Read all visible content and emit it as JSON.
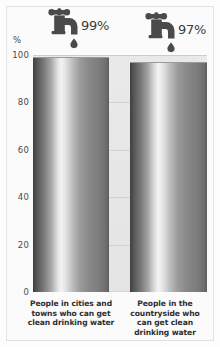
{
  "chart_data": {
    "type": "bar",
    "title": "",
    "subtitle": "",
    "xlabel": "",
    "ylabel": "%",
    "ylim": [
      0,
      100
    ],
    "grid": true,
    "legend": "none",
    "categories": [
      "People in cities and towns who can get clean drinking water",
      "People in the countryside who can get clean drinking water"
    ],
    "values": [
      99,
      97
    ],
    "value_labels": [
      "99%",
      "97%"
    ],
    "ticks": [
      {
        "value": 100,
        "label": "100"
      },
      {
        "value": 80,
        "label": "80"
      },
      {
        "value": 60,
        "label": "60"
      },
      {
        "value": 40,
        "label": "40"
      },
      {
        "value": 20,
        "label": "20"
      },
      {
        "value": 0,
        "label": "0"
      }
    ],
    "annotations": [
      {
        "icon": "tap-icon",
        "label": "99%"
      },
      {
        "icon": "tap-icon",
        "label": "97%"
      }
    ],
    "colors": {
      "bar_dark": "#3f3f3f",
      "bar_highlight": "#f4f4f4",
      "plot_background": "#e7e7e7",
      "gridline": "#d2d2d2",
      "icon": "#4a4a4a",
      "text": "#2e2e2e"
    }
  }
}
